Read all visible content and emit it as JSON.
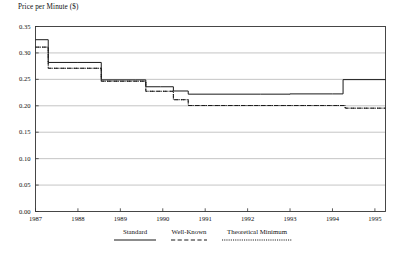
{
  "chart_data": {
    "type": "line",
    "title": "Price per Minute ($)",
    "xlabel": "",
    "ylabel": "Price per Minute ($)",
    "xlim": [
      1987,
      1995.25
    ],
    "ylim": [
      0.0,
      0.35
    ],
    "yticks": [
      "0.00",
      "0.05",
      "0.10",
      "0.15",
      "0.20",
      "0.25",
      "0.30",
      "0.35"
    ],
    "ytick_values": [
      0.0,
      0.05,
      0.1,
      0.15,
      0.2,
      0.25,
      0.3,
      0.35
    ],
    "xticks": [
      "1987",
      "1988",
      "1989",
      "1990",
      "1991",
      "1992",
      "1993",
      "1994",
      "1995"
    ],
    "xtick_values": [
      1987,
      1988,
      1989,
      1990,
      1991,
      1992,
      1993,
      1994,
      1995
    ],
    "grid": true,
    "grid_axis": "y",
    "legend_position": "bottom",
    "step_style": "post",
    "series": [
      {
        "name": "Standard",
        "style": "solid",
        "color": "#1a1a1a",
        "x": [
          1987.0,
          1987.3,
          1988.0,
          1988.55,
          1989.35,
          1989.6,
          1989.95,
          1990.25,
          1990.6,
          1992.3,
          1993.0,
          1994.0,
          1994.25,
          1995.25
        ],
        "y": [
          0.325,
          0.282,
          0.282,
          0.249,
          0.249,
          0.236,
          0.236,
          0.228,
          0.222,
          0.222,
          0.2225,
          0.2225,
          0.2495,
          0.2495
        ]
      },
      {
        "name": "Well-Known",
        "style": "dashed",
        "color": "#1a1a1a",
        "x": [
          1987.0,
          1987.3,
          1988.0,
          1988.55,
          1989.35,
          1989.6,
          1989.95,
          1990.25,
          1990.6,
          1993.95,
          1994.3,
          1995.25
        ],
        "y": [
          0.311,
          0.271,
          0.271,
          0.2465,
          0.2465,
          0.2275,
          0.2275,
          0.2115,
          0.2005,
          0.2005,
          0.1955,
          0.1955
        ]
      },
      {
        "name": "Theoretical Minimum",
        "style": "dotted",
        "color": "#1a1a1a",
        "x": [
          1987.0,
          1987.3,
          1988.0,
          1988.55,
          1989.35,
          1989.6,
          1989.95,
          1990.25,
          1990.6,
          1993.95,
          1994.3,
          1995.25
        ],
        "y": [
          0.311,
          0.271,
          0.271,
          0.2465,
          0.2465,
          0.2275,
          0.2275,
          0.2115,
          0.2005,
          0.2005,
          0.1955,
          0.1955
        ]
      }
    ]
  },
  "legend": {
    "entries": [
      {
        "label": "Standard"
      },
      {
        "label": "Well-Known"
      },
      {
        "label": "Theoretical Minimum"
      }
    ]
  },
  "colors": {
    "axis": "#333333",
    "grid": "#aaaaaa",
    "line": "#1a1a1a",
    "background": "#ffffff"
  }
}
